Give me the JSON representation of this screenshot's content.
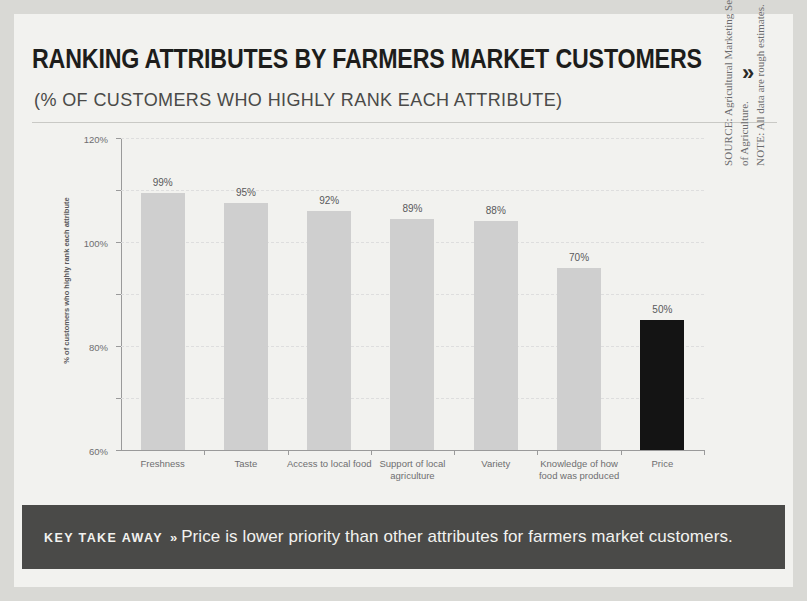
{
  "header": {
    "title": "RANKING ATTRIBUTES BY FARMERS MARKET CUSTOMERS",
    "title_chevron": "»",
    "subtitle": "(% OF CUSTOMERS WHO HIGHLY RANK EACH ATTRIBUTE)"
  },
  "source": {
    "source_lead": "SOURCE:",
    "source_text": " Agricultural Marketing Service of the U.S. Department of Agriculture.",
    "note_lead": "NOTE:",
    "note_text": " All data are rough estimates."
  },
  "banner": {
    "key_label": "KEY TAKE AWAY",
    "chevron": "»",
    "text": "Price is lower priority than other attributes for farmers market customers."
  },
  "colors": {
    "bar": "#cfcfcf",
    "bar_highlight": "#141414",
    "banner_bg": "#4a4a48",
    "sheet_bg": "#f2f2ef",
    "grid": "#dedede"
  },
  "chart_data": {
    "type": "bar",
    "title": "RANKING ATTRIBUTES BY FARMERS MARKET CUSTOMERS",
    "subtitle": "(% OF CUSTOMERS WHO HIGHLY RANK EACH ATTRIBUTE)",
    "xlabel": "",
    "ylabel": "% of customers who highly rank each attribute",
    "ylim": [
      0,
      120
    ],
    "yticks": [
      0,
      20,
      40,
      60,
      80,
      100,
      120
    ],
    "ytick_labels": [
      "0%",
      "20%",
      "40%",
      "60%",
      "80%",
      "100%",
      "120%"
    ],
    "grid": true,
    "legend": false,
    "categories": [
      "Freshness",
      "Taste",
      "Access to local food",
      "Support of local agriculture",
      "Variety",
      "Knowledge of how food was produced",
      "Price"
    ],
    "values": [
      99,
      95,
      92,
      89,
      88,
      70,
      50
    ],
    "value_labels": [
      "99%",
      "95%",
      "92%",
      "89%",
      "88%",
      "70%",
      "50%"
    ],
    "highlight_index": 6,
    "bars": [
      {
        "category": "Freshness",
        "value": 99,
        "label": "99%",
        "highlight": false
      },
      {
        "category": "Taste",
        "value": 95,
        "label": "95%",
        "highlight": false
      },
      {
        "category": "Access to local food",
        "value": 92,
        "label": "92%",
        "highlight": false
      },
      {
        "category": "Support of local agriculture",
        "value": 89,
        "label": "89%",
        "highlight": false
      },
      {
        "category": "Variety",
        "value": 88,
        "label": "88%",
        "highlight": false
      },
      {
        "category": "Knowledge of how food was produced",
        "value": 70,
        "label": "70%",
        "highlight": false
      },
      {
        "category": "Price",
        "value": 50,
        "label": "50%",
        "highlight": true
      }
    ]
  }
}
